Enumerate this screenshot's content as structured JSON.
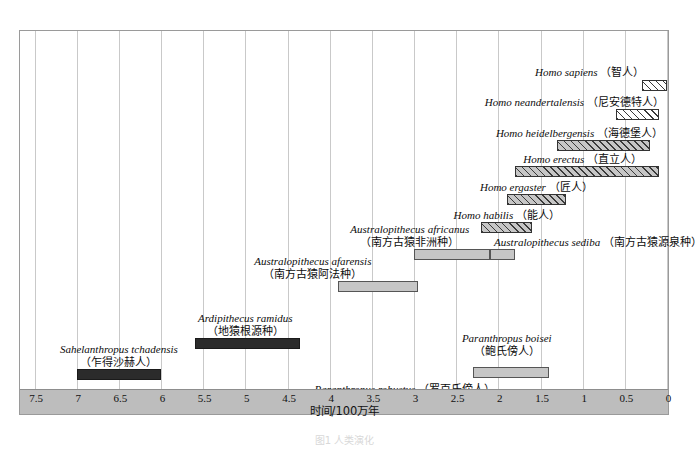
{
  "figure": {
    "caption": "图1  人类演化",
    "axis_title": "时间/100万年"
  },
  "chart_data": {
    "type": "bar",
    "orientation": "horizontal-range",
    "title": "",
    "xlabel": "时间/100万年",
    "ylabel": "",
    "xlim": [
      7.5,
      0
    ],
    "x_axis_direction": "reversed",
    "grid": true,
    "legend": "none",
    "tick_labels": [
      "7.5",
      "7",
      "6.5",
      "6",
      "5.5",
      "5",
      "4.5",
      "4",
      "3.5",
      "3",
      "2.5",
      "2",
      "1.5",
      "1",
      "0.5",
      "0"
    ],
    "ticks": [
      7.5,
      7,
      6.5,
      6,
      5.5,
      5,
      4.5,
      4,
      3.5,
      3,
      2.5,
      2,
      1.5,
      1,
      0.5,
      0
    ],
    "bars": [
      {
        "name_latin": "Homo sapiens",
        "name_cn": "（智人）",
        "start": 0.3,
        "end": 0.0,
        "style": "hatch-light",
        "label_align": "right",
        "label_lines": [
          "Homo sapiens|（智人）"
        ]
      },
      {
        "name_latin": "Homo neandertalensis",
        "name_cn": "（尼安德特人）",
        "start": 0.6,
        "end": 0.1,
        "style": "hatch-light",
        "label_align": "right",
        "label_lines": [
          "Homo neandertalensis|（尼安德特人）"
        ]
      },
      {
        "name_latin": "Homo heidelbergensis",
        "name_cn": "（海德堡人）",
        "start": 1.3,
        "end": 0.2,
        "style": "hatch",
        "label_align": "right",
        "label_lines": [
          "Homo heidelbergensis|（海德堡人）"
        ]
      },
      {
        "name_latin": "Homo erectus",
        "name_cn": "（直立人）",
        "start": 1.8,
        "end": 0.1,
        "style": "hatch",
        "label_align": "center",
        "label_lines": [
          "Homo erectus|（直立人）"
        ]
      },
      {
        "name_latin": "Homo ergaster",
        "name_cn": "（匠人）",
        "start": 1.9,
        "end": 1.2,
        "style": "hatch",
        "label_align": "center",
        "label_lines": [
          "Homo ergaster|（匠人）"
        ]
      },
      {
        "name_latin": "Homo habilis",
        "name_cn": "（能人）",
        "start": 2.2,
        "end": 1.6,
        "style": "hatch",
        "label_align": "center",
        "label_lines": [
          "Homo habilis|（能人）"
        ]
      },
      {
        "name_latin": "Australopithecus africanus",
        "name_cn": "（南方古猿非洲种）",
        "start": 3.0,
        "end": 2.1,
        "style": "plain-gray",
        "label_align": "center",
        "label_lines": [
          "Australopithecus africanus",
          "（南方古猿非洲种）"
        ]
      },
      {
        "name_latin": "Australopithecus sediba",
        "name_cn": "（南方古猿源泉种）",
        "start": 2.1,
        "end": 1.8,
        "style": "plain-gray",
        "label_align": "left",
        "label_lines": [
          "Australopithecus sediba|（南方古猿源泉种）"
        ]
      },
      {
        "name_latin": "Australopithecus afarensis",
        "name_cn": "（南方古猿阿法种）",
        "start": 3.9,
        "end": 2.95,
        "style": "plain-gray",
        "label_align": "center",
        "label_lines": [
          "Australopithecus afarensis",
          "（南方古猿阿法种）"
        ]
      },
      {
        "name_latin": "Ardipithecus ramidus",
        "name_cn": "（地猿根源种）",
        "start": 5.6,
        "end": 4.35,
        "style": "solid-dark",
        "label_align": "center",
        "label_lines": [
          "Ardipithecus ramidus",
          "（地猿根源种）"
        ]
      },
      {
        "name_latin": "Sahelanthropus tchadensis",
        "name_cn": "（乍得沙赫人）",
        "start": 7.0,
        "end": 6.0,
        "style": "solid-dark",
        "label_align": "center",
        "label_lines": [
          "Sahelanthropus tchadensis",
          "（乍得沙赫人）"
        ]
      },
      {
        "name_latin": "Paranthropus boisei",
        "name_cn": "（鲍氏傍人）",
        "start": 2.3,
        "end": 1.4,
        "style": "plain-gray",
        "label_align": "center",
        "label_lines": [
          "Paranthropus boisei",
          "（鲍氏傍人）"
        ]
      },
      {
        "name_latin": "Paranthropus robustus",
        "name_cn": "（罗百氏傍人）",
        "start": 2.0,
        "end": 1.5,
        "style": "plain-gray",
        "label_align": "right",
        "label_lines": [
          "Paranthropus robustus|（罗百氏傍人）"
        ]
      }
    ]
  },
  "colors": {
    "grid": "#c9c9c9",
    "axis_strip": "#bdbdbd",
    "bar_dark": "#2b2b2b",
    "bar_gray": "#c6c6c6",
    "frame": "#9a9a9a"
  }
}
